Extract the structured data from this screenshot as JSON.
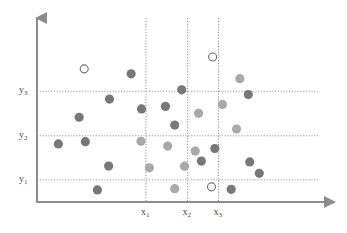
{
  "chart_data": {
    "type": "scatter",
    "title": "",
    "subtitle": "",
    "xlabel": "",
    "ylabel": "",
    "grid": true,
    "legend_position": "none",
    "xlim": [
      0,
      100
    ],
    "ylim": [
      0,
      100
    ],
    "axis_ticks": {
      "x": [
        {
          "label": "x",
          "sub": "1",
          "value": 38.8
        },
        {
          "label": "x",
          "sub": "2",
          "value": 53.6
        },
        {
          "label": "x",
          "sub": "3",
          "value": 64.6
        }
      ],
      "y": [
        {
          "label": "y",
          "sub": "1",
          "value": 12.5
        },
        {
          "label": "y",
          "sub": "2",
          "value": 37.2
        },
        {
          "label": "y",
          "sub": "3",
          "value": 62.2
        }
      ]
    },
    "vertical_dividers": [
      38.8,
      53.6,
      64.6
    ],
    "horizontal_dividers": [
      12.5,
      37.2,
      62.2
    ],
    "series": [
      {
        "name": "dark",
        "marker": "filled-circle",
        "color": "#787878",
        "points": [
          {
            "x": 15.0,
            "y": 47.6
          },
          {
            "x": 25.8,
            "y": 57.8
          },
          {
            "x": 7.6,
            "y": 32.6
          },
          {
            "x": 17.2,
            "y": 33.9
          },
          {
            "x": 25.5,
            "y": 20.2
          },
          {
            "x": 21.5,
            "y": 6.8
          },
          {
            "x": 33.5,
            "y": 72.0
          },
          {
            "x": 37.2,
            "y": 52.3
          },
          {
            "x": 45.7,
            "y": 53.7
          },
          {
            "x": 51.5,
            "y": 63.0
          },
          {
            "x": 49.0,
            "y": 43.2
          },
          {
            "x": 63.3,
            "y": 30.0
          },
          {
            "x": 58.5,
            "y": 23.0
          },
          {
            "x": 75.7,
            "y": 22.5
          },
          {
            "x": 79.1,
            "y": 16.1
          },
          {
            "x": 69.1,
            "y": 7.1
          },
          {
            "x": 75.2,
            "y": 60.4
          }
        ]
      },
      {
        "name": "light",
        "marker": "filled-circle",
        "color": "#a9a9a9",
        "points": [
          {
            "x": 37.0,
            "y": 34.1
          },
          {
            "x": 46.5,
            "y": 31.4
          },
          {
            "x": 56.3,
            "y": 28.6
          },
          {
            "x": 40.0,
            "y": 19.2
          },
          {
            "x": 52.5,
            "y": 20.1
          },
          {
            "x": 49.0,
            "y": 7.5
          },
          {
            "x": 57.5,
            "y": 49.8
          },
          {
            "x": 66.0,
            "y": 54.8
          },
          {
            "x": 71.0,
            "y": 41.0
          },
          {
            "x": 72.2,
            "y": 69.3
          }
        ]
      },
      {
        "name": "open",
        "marker": "open-circle",
        "color": "#6e6e6e",
        "points": [
          {
            "x": 16.8,
            "y": 74.8
          },
          {
            "x": 62.5,
            "y": 81.5
          },
          {
            "x": 62.1,
            "y": 8.5
          }
        ]
      }
    ]
  },
  "style": {
    "axis_color": "#8c8c8c",
    "grid_color": "#9a9a9a",
    "divider_color": "#8e8e8e",
    "label_color": "#4d4d4d",
    "background": "#ffffff"
  }
}
